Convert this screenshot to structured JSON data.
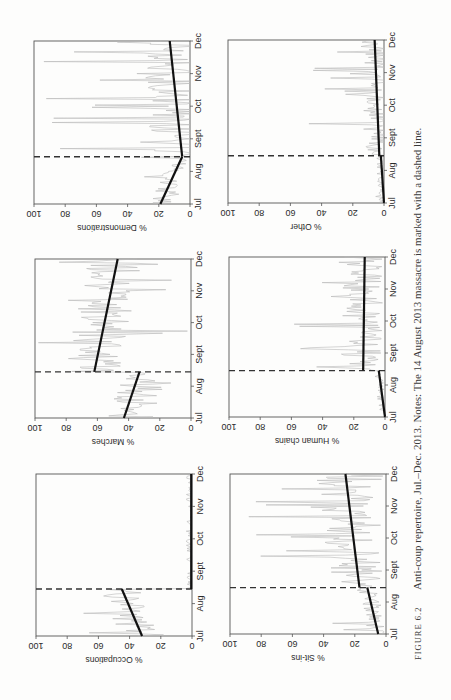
{
  "figure": {
    "label": "FIGURE 6.2",
    "caption": "Anti-coup repertoire, Jul.–Dec. 2013. Notes: The 14 August 2013 massacre is marked with a dashed line.",
    "orientation": "page rotated 90° counter-clockwise"
  },
  "chart_data": [
    {
      "type": "line",
      "title": "% Occupations",
      "xlabel": "",
      "ylabel": "% Occupations",
      "x_ticks": [
        "Jul",
        "Aug",
        "Sept",
        "Oct",
        "Nov",
        "Dec"
      ],
      "y_ticks": [
        0,
        20,
        40,
        60,
        80,
        100
      ],
      "ylim": [
        0,
        100
      ],
      "event_marker": {
        "date": "14 Aug",
        "style": "dashed"
      },
      "trend": [
        {
          "segment": "pre",
          "start": {
            "x": "Jul",
            "y": 32
          },
          "end": {
            "x": "14 Aug",
            "y": 45
          }
        },
        {
          "segment": "post",
          "start": {
            "x": "14 Aug",
            "y": 0.5
          },
          "end": {
            "x": "Dec",
            "y": 0.5
          }
        }
      ],
      "daily_series_range": {
        "pre": [
          0,
          75
        ],
        "post": [
          0,
          1
        ]
      }
    },
    {
      "type": "line",
      "title": "% Marches",
      "ylabel": "% Marches",
      "x_ticks": [
        "Jul",
        "Aug",
        "Sept",
        "Oct",
        "Nov",
        "Dec"
      ],
      "y_ticks": [
        0,
        20,
        40,
        60,
        80,
        100
      ],
      "ylim": [
        0,
        100
      ],
      "event_marker": {
        "date": "14 Aug",
        "style": "dashed"
      },
      "trend": [
        {
          "segment": "pre",
          "start": {
            "x": "Jul",
            "y": 43
          },
          "end": {
            "x": "14 Aug",
            "y": 33
          }
        },
        {
          "segment": "post",
          "start": {
            "x": "14 Aug",
            "y": 62
          },
          "end": {
            "x": "Dec",
            "y": 47
          }
        }
      ],
      "daily_series_range": {
        "pre": [
          5,
          60
        ],
        "post": [
          0,
          100
        ]
      }
    },
    {
      "type": "line",
      "title": "% Demonstrations",
      "ylabel": "% Demonstrations",
      "x_ticks": [
        "Jul",
        "Aug",
        "Sept",
        "Oct",
        "Nov",
        "Dec"
      ],
      "y_ticks": [
        0,
        20,
        40,
        60,
        80,
        100
      ],
      "ylim": [
        0,
        100
      ],
      "event_marker": {
        "date": "14 Aug",
        "style": "dashed"
      },
      "trend": [
        {
          "segment": "pre",
          "start": {
            "x": "Jul",
            "y": 19
          },
          "end": {
            "x": "14 Aug",
            "y": 5
          }
        },
        {
          "segment": "post",
          "start": {
            "x": "14 Aug",
            "y": 5
          },
          "end": {
            "x": "Dec",
            "y": 13
          }
        }
      ],
      "daily_series_range": {
        "pre": [
          0,
          40
        ],
        "post": [
          0,
          100
        ]
      }
    },
    {
      "type": "line",
      "title": "% Sit-ins",
      "ylabel": "% Sit-ins",
      "x_ticks": [
        "Jul",
        "Aug",
        "Sept",
        "Oct",
        "Nov",
        "Dec"
      ],
      "y_ticks": [
        0,
        20,
        40,
        60,
        80,
        100
      ],
      "ylim": [
        0,
        100
      ],
      "event_marker": {
        "date": "14 Aug",
        "style": "dashed"
      },
      "trend": [
        {
          "segment": "pre",
          "start": {
            "x": "Jul",
            "y": 5
          },
          "end": {
            "x": "14 Aug",
            "y": 12
          }
        },
        {
          "segment": "post",
          "start": {
            "x": "14 Aug",
            "y": 17
          },
          "end": {
            "x": "Dec",
            "y": 26
          }
        }
      ],
      "daily_series_range": {
        "pre": [
          0,
          40
        ],
        "post": [
          0,
          100
        ]
      }
    },
    {
      "type": "line",
      "title": "% Human chains",
      "ylabel": "% Human chains",
      "x_ticks": [
        "Jul",
        "Aug",
        "Sept",
        "Oct",
        "Nov",
        "Dec"
      ],
      "y_ticks": [
        0,
        20,
        40,
        60,
        80,
        100
      ],
      "ylim": [
        0,
        100
      ],
      "event_marker": {
        "date": "14 Aug",
        "style": "dashed"
      },
      "trend": [
        {
          "segment": "pre",
          "start": {
            "x": "Jul",
            "y": 0
          },
          "end": {
            "x": "14 Aug",
            "y": 4
          }
        },
        {
          "segment": "post",
          "start": {
            "x": "14 Aug",
            "y": 14
          },
          "end": {
            "x": "Dec",
            "y": 13
          }
        }
      ],
      "daily_series_range": {
        "pre": [
          0,
          8
        ],
        "post": [
          0,
          75
        ]
      }
    },
    {
      "type": "line",
      "title": "% Other",
      "ylabel": "% Other",
      "x_ticks": [
        "Jul",
        "Aug",
        "Sept",
        "Oct",
        "Nov",
        "Dec"
      ],
      "y_ticks": [
        0,
        20,
        40,
        60,
        80,
        100
      ],
      "ylim": [
        0,
        100
      ],
      "event_marker": {
        "date": "14 Aug",
        "style": "dashed"
      },
      "trend": [
        {
          "segment": "pre",
          "start": {
            "x": "Jul",
            "y": 0
          },
          "end": {
            "x": "14 Aug",
            "y": 2
          }
        },
        {
          "segment": "post",
          "start": {
            "x": "14 Aug",
            "y": 3
          },
          "end": {
            "x": "Dec",
            "y": 6
          }
        }
      ],
      "daily_series_range": {
        "pre": [
          0,
          6
        ],
        "post": [
          0,
          50
        ]
      }
    }
  ],
  "panels": [
    {
      "id": "occupations",
      "ylabel": "% Occupations",
      "left": 36,
      "top": 474,
      "right": 192,
      "bottom": 636
    },
    {
      "id": "marches",
      "ylabel": "% Marches",
      "left": 35,
      "top": 259,
      "right": 191,
      "bottom": 418
    },
    {
      "id": "demonstrations",
      "ylabel": "% Demonstrations",
      "left": 34,
      "top": 41,
      "right": 190,
      "bottom": 204
    },
    {
      "id": "sit-ins",
      "ylabel": "% Sit-ins",
      "left": 230,
      "top": 474,
      "right": 386,
      "bottom": 634
    },
    {
      "id": "human-chains",
      "ylabel": "% Human chains",
      "left": 229,
      "top": 257,
      "right": 385,
      "bottom": 417
    },
    {
      "id": "other",
      "ylabel": "% Other",
      "left": 228,
      "top": 40,
      "right": 384,
      "bottom": 203
    }
  ],
  "colors": {
    "frame": "#555555",
    "trend": "#111111",
    "daily": "#b9b9b9",
    "dashed": "#333333",
    "text": "#2a2a2a"
  }
}
